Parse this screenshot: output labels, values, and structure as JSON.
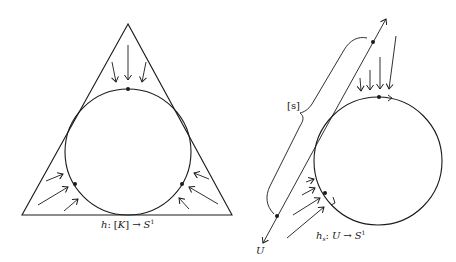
{
  "figure": {
    "left": {
      "caption": {
        "map": "h",
        "colon": ":",
        "domain_open": "[",
        "domain": "K",
        "domain_close": "]",
        "arrow": "→",
        "codomain": "S",
        "codomain_sup": "1"
      },
      "shapes": {
        "triangle": {
          "points": "128,24 22,215 232,215"
        },
        "circle": {
          "cx": 128,
          "cy": 152,
          "r": 63
        },
        "dots": [
          {
            "name": "top-point",
            "cx": 128,
            "cy": 89
          },
          {
            "name": "left-point",
            "cx": 75,
            "cy": 184
          },
          {
            "name": "right-point",
            "cx": 182,
            "cy": 184
          }
        ]
      }
    },
    "right": {
      "caption": {
        "map": "h",
        "map_sub": "s",
        "colon": ":",
        "domain": "U",
        "arrow": "→",
        "codomain": "S",
        "codomain_sup": "1"
      },
      "line_label": "U",
      "brace_label": "[s]",
      "shapes": {
        "line": {
          "x1": 263,
          "y1": 243,
          "x2": 386,
          "y2": 19
        },
        "circle": {
          "cx": 378,
          "cy": 161,
          "r": 64
        },
        "line_dots": [
          {
            "name": "upper-line-point",
            "cx": 373,
            "cy": 42
          },
          {
            "name": "lower-line-point",
            "cx": 277,
            "cy": 216
          }
        ],
        "circle_dots": [
          {
            "name": "top-circle-point",
            "cx": 379,
            "cy": 97
          },
          {
            "name": "lower-circle-point",
            "cx": 325,
            "cy": 193
          }
        ]
      }
    }
  }
}
